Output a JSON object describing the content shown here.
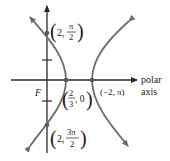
{
  "diagram": {
    "type": "polar-hyperbola",
    "colors": {
      "axis": "#2a2a2a",
      "curve": "#6e6e6e",
      "point": "#5a5a5a",
      "text": "#1a1a1a"
    },
    "focus_label": "F",
    "axis_label_line1": "polar",
    "axis_label_line2": "axis",
    "points": [
      {
        "label_r": "2,",
        "label_num": "π",
        "label_den": "2",
        "desc": "(2, π/2)"
      },
      {
        "label_num": "2",
        "label_den": "3",
        "label_theta": ", 0",
        "desc": "(2/3, 0)"
      },
      {
        "label": "(−2, π)",
        "desc": "(−2, π)"
      },
      {
        "label_r": "2,",
        "label_num": "3π",
        "label_den": "2",
        "desc": "(2, 3π/2)"
      }
    ]
  }
}
